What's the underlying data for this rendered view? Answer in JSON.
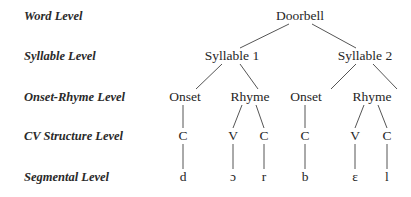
{
  "levels": [
    {
      "id": "word",
      "label": "Word Level"
    },
    {
      "id": "syllable",
      "label": "Syllable Level"
    },
    {
      "id": "onset_rhyme",
      "label": "Onset-Rhyme Level"
    },
    {
      "id": "cv",
      "label": "CV Structure Level"
    },
    {
      "id": "segmental",
      "label": "Segmental Level"
    }
  ],
  "tree": {
    "word": "Doorbell",
    "syllables": [
      {
        "label": "Syllable 1",
        "onset": {
          "label": "Onset",
          "cv": [
            "C"
          ],
          "segments": [
            "d"
          ]
        },
        "rhyme": {
          "label": "Rhyme",
          "cv": [
            "V",
            "C"
          ],
          "segments": [
            "ɔ",
            "r"
          ]
        }
      },
      {
        "label": "Syllable 2",
        "onset": {
          "label": "Onset",
          "cv": [
            "C"
          ],
          "segments": [
            "b"
          ]
        },
        "rhyme": {
          "label": "Rhyme",
          "cv": [
            "V",
            "C"
          ],
          "segments": [
            "ɛ",
            "l"
          ]
        }
      }
    ]
  }
}
